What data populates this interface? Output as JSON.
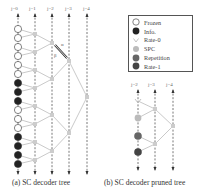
{
  "figure": {
    "tree_a": {
      "caption": "(a) SC decoder tree",
      "stage_labels": [
        "j=0",
        "j=1",
        "j=2",
        "j=3",
        "j=4"
      ],
      "leaves": [
        "frozen",
        "frozen",
        "frozen",
        "frozen",
        "frozen",
        "frozen",
        "info",
        "info",
        "info",
        "frozen",
        "frozen",
        "frozen",
        "info",
        "info",
        "info",
        "info"
      ],
      "edge_labels": {
        "alpha": "α",
        "beta": "β"
      }
    },
    "tree_b": {
      "caption": "(b) SC decoder pruned tree",
      "stage_labels": [
        "j=2",
        "j=3",
        "j=4"
      ],
      "leaves": [
        "rate-0",
        "spc",
        "repetition",
        "rate-1"
      ]
    },
    "legend": {
      "items": [
        {
          "key": "frozen",
          "label": "Frozen",
          "color": "#ffffff"
        },
        {
          "key": "info",
          "label": "Info.",
          "color": "#222222"
        },
        {
          "key": "rate-0",
          "label": "Rate-0",
          "color": "#dddddd"
        },
        {
          "key": "spc",
          "label": "SPC",
          "color": "#bbbbbb"
        },
        {
          "key": "repetition",
          "label": "Repetition",
          "color": "#666666"
        },
        {
          "key": "rate-1",
          "label": "Rate-1",
          "color": "#444444"
        }
      ]
    },
    "colors": {
      "edge": "#bbbbbb",
      "internal_node": "#cccccc",
      "dashed_line": "#555555"
    }
  }
}
